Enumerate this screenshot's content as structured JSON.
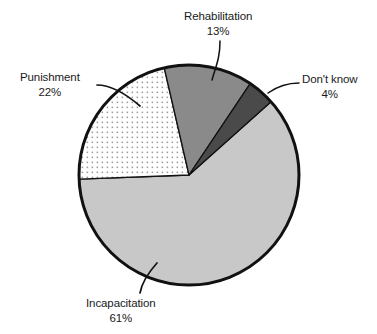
{
  "chart_data": {
    "type": "pie",
    "title": "",
    "subtitle": "",
    "xlabel": "",
    "ylabel": "",
    "legend_position": "none",
    "grid": false,
    "units": "percent",
    "total": 100,
    "start_angle_deg": -13,
    "direction": "clockwise",
    "categories": [
      "Rehabilitation",
      "Don't know",
      "Incapacitation",
      "Punishment"
    ],
    "values": [
      13,
      4,
      61,
      22
    ],
    "slices": [
      {
        "label": "Rehabilitation",
        "value": 13,
        "value_text": "13%",
        "fill": "#8a8a8a",
        "pattern": "solid",
        "label_position": "top"
      },
      {
        "label": "Don't know",
        "value": 4,
        "value_text": "4%",
        "fill": "#4a4a4a",
        "pattern": "solid",
        "label_position": "right"
      },
      {
        "label": "Incapacitation",
        "value": 61,
        "value_text": "61%",
        "fill": "#c8c8c8",
        "pattern": "solid",
        "label_position": "bottom"
      },
      {
        "label": "Punishment",
        "value": 22,
        "value_text": "22%",
        "fill": "#ffffff",
        "pattern": "dotted",
        "label_position": "left"
      }
    ],
    "colors": {
      "rehabilitation": "#8a8a8a",
      "dont_know": "#4a4a4a",
      "incapacitation": "#c8c8c8",
      "punishment": "#ffffff",
      "outline": "#111111",
      "dot_pattern": "#9a9a9a",
      "text": "#1a1a1a",
      "background": "#ffffff"
    },
    "geometry": {
      "center_x": 189,
      "center_y": 175,
      "radius": 110
    }
  },
  "labels": {
    "rehabilitation": {
      "name": "Rehabilitation",
      "value": "13%"
    },
    "punishment": {
      "name": "Punishment",
      "value": "22%"
    },
    "dont_know": {
      "name": "Don't know",
      "value": "4%"
    },
    "incapacitation": {
      "name": "Incapacitation",
      "value": "61%"
    }
  }
}
